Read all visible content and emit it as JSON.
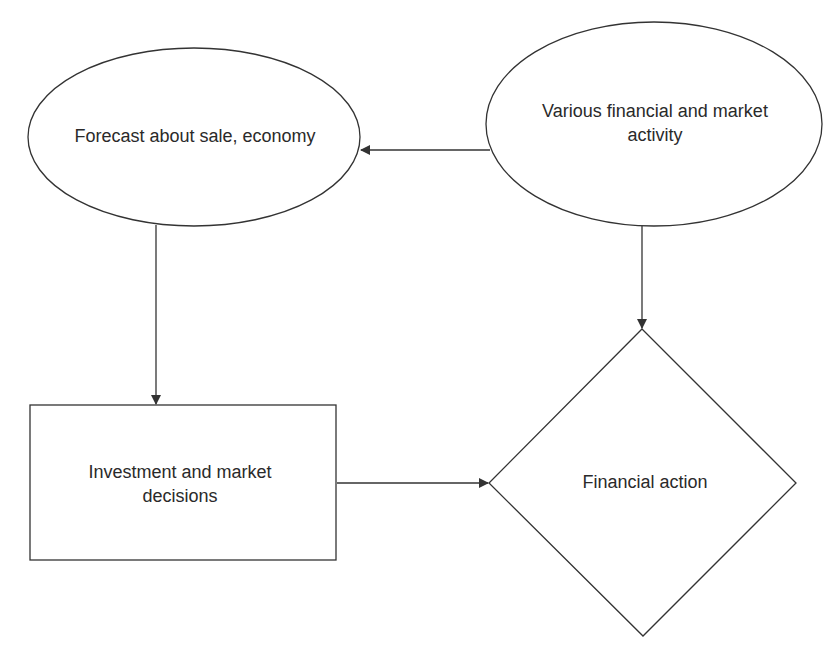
{
  "diagram": {
    "type": "flowchart",
    "stroke_color": "#333333",
    "nodes": [
      {
        "id": "forecast",
        "shape": "ellipse",
        "label": "Forecast about sale, economy"
      },
      {
        "id": "activity",
        "shape": "ellipse",
        "label": "Various financial and market activity"
      },
      {
        "id": "decisions",
        "shape": "rectangle",
        "label": "Investment and market decisions"
      },
      {
        "id": "action",
        "shape": "diamond",
        "label": "Financial action"
      }
    ],
    "edges": [
      {
        "from": "activity",
        "to": "forecast"
      },
      {
        "from": "forecast",
        "to": "decisions"
      },
      {
        "from": "activity",
        "to": "action"
      },
      {
        "from": "decisions",
        "to": "action"
      }
    ]
  }
}
